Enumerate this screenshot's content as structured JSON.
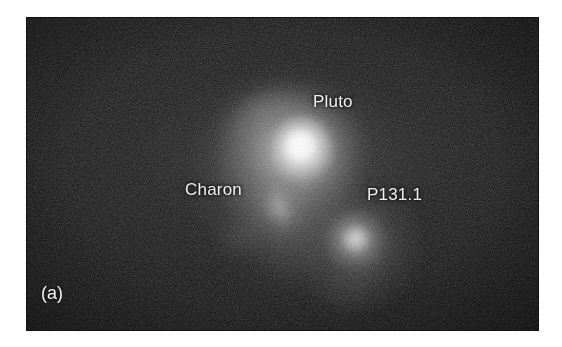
{
  "figure": {
    "panel_label": "(a)",
    "background_color": "#ffffff",
    "plate_color": "#060606",
    "label_color": "#f2f2f2"
  },
  "image_plate": {
    "frame": {
      "x": 27,
      "y": 18,
      "width": 511,
      "height": 312
    },
    "description": "Dark astronomical CCD image of the Pluto system showing three resolved sources"
  },
  "annotations": [
    {
      "id": "pluto",
      "label": "Pluto",
      "label_x": 286,
      "label_y": 74,
      "source_x": 273,
      "source_y": 130,
      "brightness": "brightest",
      "color": "#ffffff"
    },
    {
      "id": "charon",
      "label": "Charon",
      "label_x": 158,
      "label_y": 162,
      "source_x": 252,
      "source_y": 190,
      "brightness": "faint",
      "color": "#cdcdcd"
    },
    {
      "id": "p131",
      "label": "P131.1",
      "label_x": 340,
      "label_y": 167,
      "source_x": 329,
      "source_y": 223,
      "brightness": "medium",
      "color": "#dedede"
    }
  ]
}
